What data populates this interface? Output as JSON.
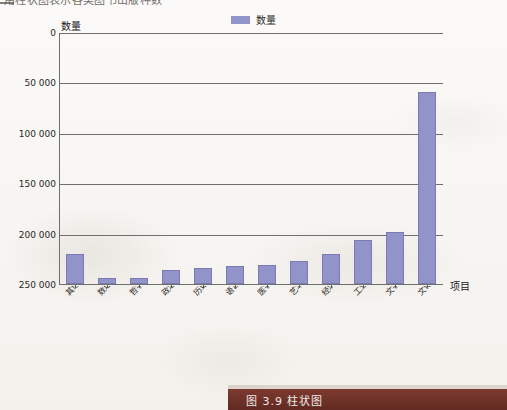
{
  "top_strip": {
    "cropped_heading": "用柱状图表示各类图书出版种数"
  },
  "legend": {
    "entries": [
      {
        "label": "数量",
        "color": "#9293c8",
        "icon": "legend-swatch"
      }
    ]
  },
  "axes": {
    "y_title": "数量",
    "x_title": "项目",
    "y_ticks": [
      "250 000",
      "200 000",
      "150 000",
      "100 000",
      "50 000",
      "0"
    ]
  },
  "caption": {
    "text": "图 3.9  柱状图",
    "bar_color": "#6e3128"
  },
  "chart_data": {
    "type": "bar",
    "title": "",
    "xlabel": "项目",
    "ylabel": "数量",
    "ylim": [
      0,
      250000
    ],
    "ytick_values": [
      0,
      50000,
      100000,
      150000,
      200000,
      250000
    ],
    "grid": true,
    "legend_position": "top-center",
    "series": [
      {
        "name": "数量",
        "color": "#9293c8",
        "values": [
          30000,
          6000,
          6000,
          14000,
          16000,
          18000,
          18500,
          23000,
          30000,
          44000,
          52000,
          190000
        ]
      }
    ],
    "categories": [
      "其他出版种数",
      "数理科学、化学图书出版种数",
      "哲学图书出版种数",
      "政治、法律图书出版种数",
      "历史、地理图书出版种数",
      "语言、文字图书出版种数",
      "医学、卫生图书出版种数",
      "艺术图书出版种数",
      "经济图书出版种数",
      "工业技术图书出版种数",
      "文学图书出版种数",
      "文化、科学、教育图书出版种数"
    ]
  }
}
